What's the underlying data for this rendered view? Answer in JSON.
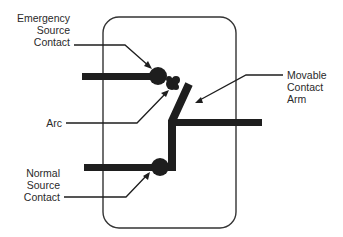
{
  "diagram": {
    "type": "transfer switch contact schematic",
    "labels": {
      "emergency_source_contact": [
        "Emergency",
        "Source",
        "Contact"
      ],
      "arc": [
        "Arc"
      ],
      "normal_source_contact": [
        "Normal",
        "Source",
        "Contact"
      ],
      "movable_contact_arm": [
        "Movable",
        "Contact",
        "Arm"
      ]
    },
    "colors": {
      "ink": "#1e1e1e",
      "frame": "#333333",
      "text": "#2a2a2a",
      "background": "#ffffff"
    }
  }
}
